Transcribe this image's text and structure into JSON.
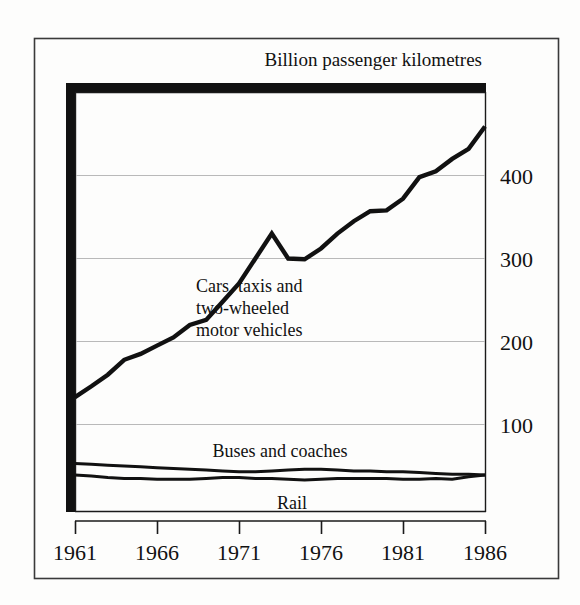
{
  "figure": {
    "title": "Billion passenger kilometres",
    "frame": {
      "visible": true,
      "color": "#3a3a3a"
    },
    "background": "#ffffff"
  },
  "chart_data": {
    "type": "line",
    "title": "Billion passenger kilometres",
    "xlabel": "",
    "ylabel": "Billion passenger kilometres",
    "xlim": [
      1961,
      1986
    ],
    "ylim": [
      0,
      480
    ],
    "grid": true,
    "grid_axis": "y",
    "legend_position": "inline-annotations",
    "x": [
      1961,
      1962,
      1963,
      1964,
      1965,
      1966,
      1967,
      1968,
      1969,
      1970,
      1971,
      1972,
      1973,
      1974,
      1975,
      1976,
      1977,
      1978,
      1979,
      1980,
      1981,
      1982,
      1983,
      1984,
      1985,
      1986
    ],
    "xticks": [
      1961,
      1966,
      1971,
      1976,
      1981,
      1986
    ],
    "xtick_labels": [
      "1961",
      "1966",
      "1971",
      "1976",
      "1981",
      "1986"
    ],
    "yticks": [
      100,
      200,
      300,
      400
    ],
    "ytick_labels": [
      "100",
      "200",
      "300",
      "400"
    ],
    "series": [
      {
        "name": "Cars, taxis and two-wheeled motor vehicles",
        "label_lines": [
          "Cars, taxis and",
          "two-wheeled",
          "motor vehicles"
        ],
        "color": "#111111",
        "width": 4.4,
        "values": [
          133,
          146,
          160,
          178,
          185,
          195,
          205,
          220,
          226,
          248,
          270,
          300,
          330,
          300,
          299,
          312,
          330,
          345,
          357,
          358,
          372,
          398,
          405,
          420,
          432,
          459
        ]
      },
      {
        "name": "Buses and coaches",
        "label_lines": [
          "Buses and coaches"
        ],
        "color": "#111111",
        "width": 3.0,
        "values": [
          53,
          52,
          51,
          50,
          49,
          48,
          47,
          46,
          45,
          44,
          43,
          43,
          44,
          45,
          46,
          46,
          45,
          44,
          44,
          43,
          43,
          42,
          41,
          40,
          40,
          39
        ]
      },
      {
        "name": "Rail",
        "label_lines": [
          "Rail"
        ],
        "color": "#111111",
        "width": 3.0,
        "values": [
          39,
          38,
          36,
          35,
          35,
          34,
          34,
          34,
          35,
          36,
          36,
          35,
          35,
          34,
          33,
          34,
          35,
          35,
          35,
          35,
          34,
          34,
          35,
          34,
          37,
          39
        ]
      }
    ],
    "annotations": [
      {
        "text": "Cars, taxis and two-wheeled motor vehicles",
        "x": 1971.5,
        "y": 255
      },
      {
        "text": "Buses and coaches",
        "x": 1972,
        "y": 72
      },
      {
        "text": "Rail",
        "x": 1974,
        "y": 14
      }
    ]
  },
  "labels": {
    "ytick_100": "100",
    "ytick_200": "200",
    "ytick_300": "300",
    "ytick_400": "400",
    "xtick_1961": "1961",
    "xtick_1966": "1966",
    "xtick_1971": "1971",
    "xtick_1976": "1976",
    "xtick_1981": "1981",
    "xtick_1986": "1986",
    "cars_line1": "Cars, taxis and",
    "cars_line2": "two-wheeled",
    "cars_line3": "motor vehicles",
    "buses": "Buses and coaches",
    "rail": "Rail"
  }
}
